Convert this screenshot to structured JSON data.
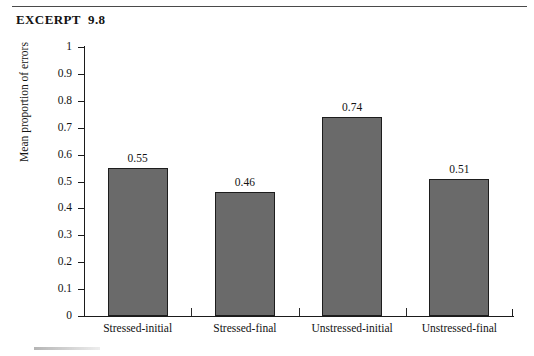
{
  "excerpt": {
    "title": "EXCERPT  9.8"
  },
  "chart_data": {
    "type": "bar",
    "title": "",
    "xlabel": "",
    "ylabel": "Mean proportion of errors",
    "categories": [
      "Stressed-initial",
      "Stressed-final",
      "Unstressed-initial",
      "Unstressed-final"
    ],
    "values": [
      0.55,
      0.46,
      0.74,
      0.51
    ],
    "value_labels": [
      "0.55",
      "0.46",
      "0.74",
      "0.51"
    ],
    "ylim": [
      0,
      1
    ],
    "ytick_values": [
      1,
      0.9,
      0.8,
      0.7,
      0.6,
      0.5,
      0.4,
      0.3,
      0.2,
      0.1,
      0
    ],
    "ytick_labels": [
      "1",
      "0.9",
      "0.8",
      "0.7",
      "0.6",
      "0.5",
      "0.4",
      "0.3",
      "0.2",
      "0.1",
      "0"
    ],
    "grid": false,
    "legend": null,
    "bar_color": "#6a6a6a",
    "bar_edge_color": "#1d1d1d",
    "axis_color": "#1b1b1b"
  }
}
